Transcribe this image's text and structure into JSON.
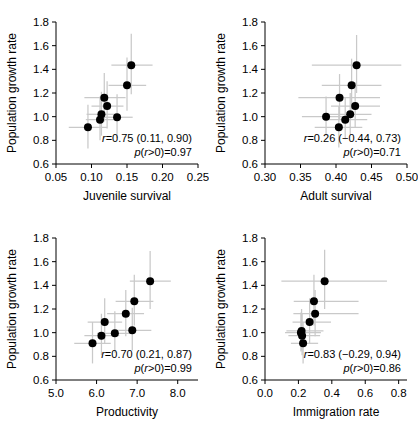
{
  "figure": {
    "y_axis_label": "Population growth rate",
    "y_ticks": [
      "1.8",
      "1.6",
      "1.4",
      "1.2",
      "1.0",
      "0.8",
      "0.6"
    ],
    "ylim": [
      0.6,
      1.8
    ]
  },
  "chart_data": [
    {
      "type": "scatter",
      "panel": "top-left",
      "title": "",
      "xlabel": "Juvenile survival",
      "ylabel": "Population growth rate",
      "xlim": [
        0.05,
        0.25
      ],
      "ylim": [
        0.6,
        1.8
      ],
      "xticks": [
        "0.05",
        "0.10",
        "0.15",
        "0.20",
        "0.25"
      ],
      "xtick_values": [
        0.05,
        0.1,
        0.15,
        0.2,
        0.25
      ],
      "yticks": [
        "0.6",
        "0.8",
        "1.0",
        "1.2",
        "1.4",
        "1.6",
        "1.8"
      ],
      "ytick_values": [
        0.6,
        0.8,
        1.0,
        1.2,
        1.4,
        1.6,
        1.8
      ],
      "grid": false,
      "legend": "none",
      "points": [
        {
          "x": 0.095,
          "y": 0.91,
          "xlo": 0.068,
          "xhi": 0.122,
          "ylo": 0.73,
          "yhi": 1.1
        },
        {
          "x": 0.112,
          "y": 0.975,
          "xlo": 0.092,
          "xhi": 0.133,
          "ylo": 0.8,
          "yhi": 1.17
        },
        {
          "x": 0.114,
          "y": 1.02,
          "xlo": 0.093,
          "xhi": 0.136,
          "ylo": 0.84,
          "yhi": 1.21
        },
        {
          "x": 0.118,
          "y": 1.16,
          "xlo": 0.09,
          "xhi": 0.148,
          "ylo": 0.96,
          "yhi": 1.37
        },
        {
          "x": 0.122,
          "y": 1.09,
          "xlo": 0.1,
          "xhi": 0.145,
          "ylo": 0.9,
          "yhi": 1.3
        },
        {
          "x": 0.136,
          "y": 0.995,
          "xlo": 0.115,
          "xhi": 0.158,
          "ylo": 0.82,
          "yhi": 1.19
        },
        {
          "x": 0.15,
          "y": 1.265,
          "xlo": 0.124,
          "xhi": 0.177,
          "ylo": 1.05,
          "yhi": 1.5
        },
        {
          "x": 0.156,
          "y": 1.435,
          "xlo": 0.128,
          "xhi": 0.186,
          "ylo": 1.19,
          "yhi": 1.7
        }
      ],
      "annotation_r": "r=0.75 (0.11, 0.90)",
      "annotation_p": "p(r>0)=0.97",
      "r": 0.75,
      "r_ci": [
        0.11,
        0.9
      ],
      "p_r_gt_0": 0.97
    },
    {
      "type": "scatter",
      "panel": "top-right",
      "title": "",
      "xlabel": "Adult survival",
      "ylabel": "Population growth rate",
      "xlim": [
        0.3,
        0.5
      ],
      "ylim": [
        0.6,
        1.8
      ],
      "xticks": [
        "0.30",
        "0.35",
        "0.40",
        "0.45",
        "0.50"
      ],
      "xtick_values": [
        0.3,
        0.35,
        0.4,
        0.45,
        0.5
      ],
      "yticks": [
        "0.6",
        "0.8",
        "1.0",
        "1.2",
        "1.4",
        "1.6",
        "1.8"
      ],
      "ytick_values": [
        0.6,
        0.8,
        1.0,
        1.2,
        1.4,
        1.6,
        1.8
      ],
      "grid": false,
      "legend": "none",
      "points": [
        {
          "x": 0.386,
          "y": 1.0,
          "xlo": 0.352,
          "xhi": 0.42,
          "ylo": 0.84,
          "yhi": 1.17
        },
        {
          "x": 0.404,
          "y": 0.91,
          "xlo": 0.37,
          "xhi": 0.437,
          "ylo": 0.74,
          "yhi": 1.09
        },
        {
          "x": 0.405,
          "y": 1.16,
          "xlo": 0.347,
          "xhi": 0.462,
          "ylo": 0.98,
          "yhi": 1.36
        },
        {
          "x": 0.413,
          "y": 0.975,
          "xlo": 0.383,
          "xhi": 0.444,
          "ylo": 0.81,
          "yhi": 1.16
        },
        {
          "x": 0.42,
          "y": 1.02,
          "xlo": 0.39,
          "xhi": 0.45,
          "ylo": 0.85,
          "yhi": 1.2
        },
        {
          "x": 0.422,
          "y": 1.265,
          "xlo": 0.38,
          "xhi": 0.464,
          "ylo": 1.06,
          "yhi": 1.49
        },
        {
          "x": 0.427,
          "y": 1.09,
          "xlo": 0.393,
          "xhi": 0.462,
          "ylo": 0.91,
          "yhi": 1.29
        },
        {
          "x": 0.429,
          "y": 1.435,
          "xlo": 0.366,
          "xhi": 0.492,
          "ylo": 1.2,
          "yhi": 1.69
        }
      ],
      "annotation_r": "r=0.26 (−0.44, 0.73)",
      "annotation_p": "p(r>0)=0.71",
      "r": 0.26,
      "r_ci": [
        -0.44,
        0.73
      ],
      "p_r_gt_0": 0.71
    },
    {
      "type": "scatter",
      "panel": "bottom-left",
      "title": "",
      "xlabel": "Productivity",
      "ylabel": "Population growth rate",
      "xlim": [
        5.0,
        8.5
      ],
      "ylim": [
        0.6,
        1.8
      ],
      "xticks": [
        "5.0",
        "6.0",
        "7.0",
        "8.0"
      ],
      "xtick_values": [
        5.0,
        6.0,
        7.0,
        8.0
      ],
      "yticks": [
        "0.6",
        "0.8",
        "1.0",
        "1.2",
        "1.4",
        "1.6",
        "1.8"
      ],
      "ytick_values": [
        0.6,
        0.8,
        1.0,
        1.2,
        1.4,
        1.6,
        1.8
      ],
      "grid": false,
      "legend": "none",
      "points": [
        {
          "x": 5.9,
          "y": 0.91,
          "xlo": 5.45,
          "xhi": 6.35,
          "ylo": 0.74,
          "yhi": 1.09
        },
        {
          "x": 6.12,
          "y": 0.975,
          "xlo": 5.7,
          "xhi": 6.56,
          "ylo": 0.81,
          "yhi": 1.16
        },
        {
          "x": 6.2,
          "y": 1.09,
          "xlo": 5.78,
          "xhi": 6.63,
          "ylo": 0.91,
          "yhi": 1.29
        },
        {
          "x": 6.45,
          "y": 0.995,
          "xlo": 6.01,
          "xhi": 6.9,
          "ylo": 0.83,
          "yhi": 1.18
        },
        {
          "x": 6.72,
          "y": 1.16,
          "xlo": 6.26,
          "xhi": 7.17,
          "ylo": 0.97,
          "yhi": 1.36
        },
        {
          "x": 6.88,
          "y": 1.02,
          "xlo": 6.42,
          "xhi": 7.35,
          "ylo": 0.85,
          "yhi": 1.21
        },
        {
          "x": 6.93,
          "y": 1.265,
          "xlo": 6.47,
          "xhi": 7.4,
          "ylo": 1.06,
          "yhi": 1.49
        },
        {
          "x": 7.32,
          "y": 1.435,
          "xlo": 6.82,
          "xhi": 7.83,
          "ylo": 1.2,
          "yhi": 1.69
        }
      ],
      "annotation_r": "r=0.70 (0.21, 0.87)",
      "annotation_p": "p(r>0)=0.99",
      "r": 0.7,
      "r_ci": [
        0.21,
        0.87
      ],
      "p_r_gt_0": 0.99
    },
    {
      "type": "scatter",
      "panel": "bottom-right",
      "title": "",
      "xlabel": "Immigration rate",
      "ylabel": "Population growth rate",
      "xlim": [
        0.0,
        0.85
      ],
      "ylim": [
        0.6,
        1.8
      ],
      "xticks": [
        "0.0",
        "0.2",
        "0.4",
        "0.6",
        "0.8"
      ],
      "xtick_values": [
        0.0,
        0.2,
        0.4,
        0.6,
        0.8
      ],
      "yticks": [
        "0.6",
        "0.8",
        "1.0",
        "1.2",
        "1.4",
        "1.6",
        "1.8"
      ],
      "ytick_values": [
        0.6,
        0.8,
        1.0,
        1.2,
        1.4,
        1.6,
        1.8
      ],
      "grid": false,
      "legend": "none",
      "points": [
        {
          "x": 0.228,
          "y": 0.91,
          "xlo": 0.155,
          "xhi": 0.318,
          "ylo": 0.74,
          "yhi": 1.09
        },
        {
          "x": 0.222,
          "y": 0.975,
          "xlo": 0.14,
          "xhi": 0.33,
          "ylo": 0.81,
          "yhi": 1.16
        },
        {
          "x": 0.215,
          "y": 1.0,
          "xlo": 0.12,
          "xhi": 0.335,
          "ylo": 0.84,
          "yhi": 1.17
        },
        {
          "x": 0.219,
          "y": 1.015,
          "xlo": 0.128,
          "xhi": 0.35,
          "ylo": 0.85,
          "yhi": 1.2
        },
        {
          "x": 0.267,
          "y": 1.09,
          "xlo": 0.165,
          "xhi": 0.395,
          "ylo": 0.91,
          "yhi": 1.29
        },
        {
          "x": 0.3,
          "y": 1.16,
          "xlo": 0.17,
          "xhi": 0.56,
          "ylo": 0.97,
          "yhi": 1.36
        },
        {
          "x": 0.293,
          "y": 1.265,
          "xlo": 0.172,
          "xhi": 0.56,
          "ylo": 1.06,
          "yhi": 1.49
        },
        {
          "x": 0.357,
          "y": 1.435,
          "xlo": 0.098,
          "xhi": 0.73,
          "ylo": 1.2,
          "yhi": 1.7
        }
      ],
      "annotation_r": "r=0.83 (−0.29, 0.94)",
      "annotation_p": "p(r>0)=0.86",
      "r": 0.83,
      "r_ci": [
        -0.29,
        0.94
      ],
      "p_r_gt_0": 0.86
    }
  ],
  "colors": {
    "point": "#000000",
    "error_bar": "#c9c9c9",
    "axis": "#000000",
    "background": "#ffffff"
  }
}
